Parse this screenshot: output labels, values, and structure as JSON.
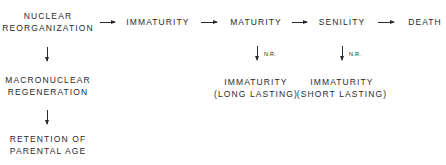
{
  "diagram": {
    "main_flow": [
      {
        "id": "nuclear_reorganization",
        "lines": [
          "NUCLEAR",
          "REORGANIZATION"
        ]
      },
      {
        "id": "immaturity",
        "lines": [
          "IMMATURITY"
        ]
      },
      {
        "id": "maturity",
        "lines": [
          "MATURITY"
        ]
      },
      {
        "id": "senility",
        "lines": [
          "SENILITY"
        ]
      },
      {
        "id": "death",
        "lines": [
          "DEATH"
        ]
      }
    ],
    "left_branch": [
      {
        "id": "macronuclear_regeneration",
        "lines": [
          "MACRONUCLEAR",
          "REGENERATION"
        ]
      },
      {
        "id": "retention_parental_age",
        "lines": [
          "RETENTION OF",
          "PARENTAL AGE"
        ]
      }
    ],
    "maturity_branch": {
      "arrow_label": "N.R.",
      "lines": [
        "IMMATURITY",
        "(LONG LASTING)"
      ]
    },
    "senility_branch": {
      "arrow_label": "N.R.",
      "lines": [
        "IMMATURITY",
        "(SHORT LASTING)"
      ]
    },
    "edges": [
      [
        "nuclear_reorganization",
        "immaturity"
      ],
      [
        "immaturity",
        "maturity"
      ],
      [
        "maturity",
        "senility"
      ],
      [
        "senility",
        "death"
      ],
      [
        "nuclear_reorganization",
        "macronuclear_regeneration"
      ],
      [
        "macronuclear_regeneration",
        "retention_parental_age"
      ],
      [
        "maturity",
        "immaturity_long_lasting"
      ],
      [
        "senility",
        "immaturity_short_lasting"
      ]
    ]
  }
}
